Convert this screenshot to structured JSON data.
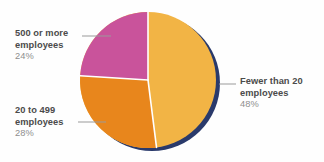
{
  "chart_data": {
    "type": "pie",
    "title": "",
    "subtitle": "",
    "xlabel": "",
    "ylabel": "",
    "legend_position": "callout-labels",
    "grid": false,
    "categories": [
      "Fewer than 20 employees",
      "20 to 499 employees",
      "500 or more employees"
    ],
    "values": [
      48,
      28,
      24
    ],
    "value_unit": "%",
    "slices": [
      {
        "name": "Fewer than 20 employees",
        "label_line1": "Fewer than 20",
        "label_line2": "employees",
        "value": 48,
        "value_label": "48%",
        "color": "#f2b445",
        "start_angle_deg": 0,
        "end_angle_deg": 172.8,
        "callout_side": "right"
      },
      {
        "name": "20 to 499 employees",
        "label_line1": "20 to 499",
        "label_line2": "employees",
        "value": 28,
        "value_label": "28%",
        "color": "#e8861c",
        "start_angle_deg": 172.8,
        "end_angle_deg": 273.6,
        "callout_side": "left"
      },
      {
        "name": "500 or more employees",
        "label_line1": "500 or more",
        "label_line2": "employees",
        "value": 24,
        "value_label": "24%",
        "color": "#c9539b",
        "start_angle_deg": 273.6,
        "end_angle_deg": 360,
        "callout_side": "left"
      }
    ],
    "colors": {
      "slice_fewer_than_20": "#f2b445",
      "slice_20_to_499": "#e8861c",
      "slice_500_or_more": "#c9539b",
      "shadow": "#2a3a6b",
      "divider": "#ffffff",
      "background": "#fefefe",
      "label_text": "#4b4b4b",
      "percent_text": "#8e8e8e",
      "leader_line": "#9a9a9a"
    },
    "geometry": {
      "center_x": 148,
      "center_y": 80,
      "radius": 68,
      "shadow_offset_x": 4,
      "shadow_offset_y": 3
    }
  }
}
